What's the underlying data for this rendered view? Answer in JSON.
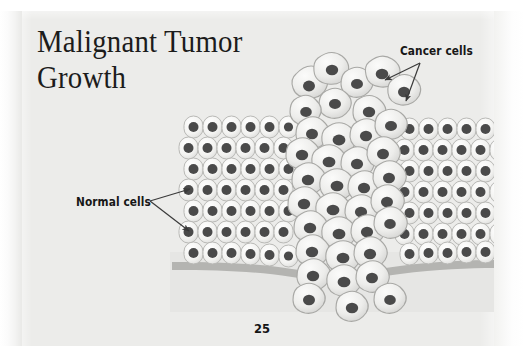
{
  "page": {
    "title_line1": "Malignant Tumor",
    "title_line2": "Growth",
    "title_full": "Malignant Tumor\nGrowth",
    "folio": "25",
    "background_color": "#ececea",
    "paper_color": "#ffffff"
  },
  "labels": {
    "cancer_cells": "Cancer cells",
    "normal_cells": "Normal cells",
    "text_color": "#171717"
  },
  "illustration": {
    "name": "malignant-tumor-growth-diagram",
    "normal_cell_fill": "#f4f4f2",
    "normal_cell_stroke": "#b9b9b6",
    "nucleus_color": "#4a4a4a",
    "cancer_cell_fill": "#eeeeec",
    "cancer_cell_stroke": "#a8a8a5",
    "membrane_color": "#b0b0ad",
    "stroma_color": "#e3e3e1",
    "arrow_color": "#3a3a3a",
    "regions": [
      "normal-epithelium-left",
      "normal-epithelium-right",
      "tumor-mass-center",
      "basement-membrane",
      "invading-cells-below"
    ]
  }
}
